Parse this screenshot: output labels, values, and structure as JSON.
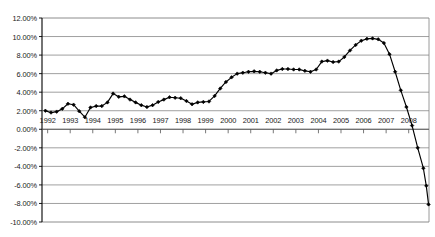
{
  "chart_data": {
    "type": "line",
    "title": "",
    "subtitle": "",
    "xlabel": "",
    "ylabel": "",
    "grid": true,
    "legend": false,
    "legend_position": "none",
    "line_color": "#000000",
    "marker": "diamond",
    "marker_color": "#000000",
    "gridline_color": "#808080",
    "axis_color": "#000000",
    "background": "#ffffff",
    "ylim": [
      -10,
      12
    ],
    "ytick_labels": [
      "12.00%",
      "10.00%",
      "8.00%",
      "6.00%",
      "4.00%",
      "2.00%",
      "0.00%",
      "-2.00%",
      "-4.00%",
      "-6.00%",
      "-8.00%",
      "-10.00%"
    ],
    "ytick_values": [
      12,
      10,
      8,
      6,
      4,
      2,
      0,
      -2,
      -4,
      -6,
      -8,
      -10
    ],
    "xtick_labels": [
      "1992",
      "1993",
      "1994",
      "1995",
      "1996",
      "1997",
      "1998",
      "1999",
      "2000",
      "2001",
      "2002",
      "2003",
      "2004",
      "2005",
      "2006",
      "2007",
      "2008"
    ],
    "xtick_values": [
      1992,
      1993,
      1994,
      1995,
      1996,
      1997,
      1998,
      1999,
      2000,
      2001,
      2002,
      2003,
      2004,
      2005,
      2006,
      2007,
      2008
    ],
    "xlim": [
      1991.75,
      2008.9
    ],
    "series": [
      {
        "name": "Series 1",
        "x": [
          1991.9,
          1992.15,
          1992.4,
          1992.65,
          1992.9,
          1993.15,
          1993.4,
          1993.65,
          1993.9,
          1994.15,
          1994.4,
          1994.65,
          1994.9,
          1995.15,
          1995.4,
          1995.65,
          1995.9,
          1996.15,
          1996.4,
          1996.65,
          1996.9,
          1997.15,
          1997.4,
          1997.65,
          1997.9,
          1998.15,
          1998.4,
          1998.65,
          1998.9,
          1999.15,
          1999.4,
          1999.65,
          1999.9,
          2000.15,
          2000.4,
          2000.65,
          2000.9,
          2001.15,
          2001.4,
          2001.65,
          2001.9,
          2002.15,
          2002.4,
          2002.65,
          2002.9,
          2003.15,
          2003.4,
          2003.65,
          2003.9,
          2004.15,
          2004.4,
          2004.65,
          2004.9,
          2005.15,
          2005.4,
          2005.65,
          2005.9,
          2006.15,
          2006.4,
          2006.65,
          2006.9,
          2007.15,
          2007.4,
          2007.65,
          2007.9,
          2008.15,
          2008.4,
          2008.65
        ],
        "values": [
          2.0,
          1.8,
          1.9,
          2.2,
          2.75,
          2.65,
          1.95,
          1.3,
          2.35,
          2.5,
          2.5,
          2.9,
          3.85,
          3.5,
          3.55,
          3.2,
          2.9,
          2.6,
          2.4,
          2.6,
          2.95,
          3.2,
          3.45,
          3.4,
          3.35,
          3.05,
          2.7,
          2.9,
          2.95,
          3.0,
          3.6,
          4.4,
          5.1,
          5.6,
          6.0,
          6.1,
          6.2,
          6.25,
          6.2,
          6.1,
          6.0,
          6.35,
          6.5,
          6.5,
          6.45,
          6.45,
          6.3,
          6.2,
          6.45,
          7.3,
          7.4,
          7.25,
          7.3,
          7.8,
          8.5,
          9.1,
          9.55,
          9.75,
          9.8,
          9.7,
          9.3,
          8.1,
          6.2,
          4.2,
          2.4,
          0.4,
          -2.0,
          -4.2
        ],
        "final_values": [
          -6.1,
          -8.1
        ],
        "final_x": [
          2008.78,
          2008.88
        ]
      }
    ]
  },
  "axes": {
    "plot_left_px": 42,
    "plot_right_px": 429,
    "plot_top_px": 18,
    "plot_bottom_px": 222
  }
}
